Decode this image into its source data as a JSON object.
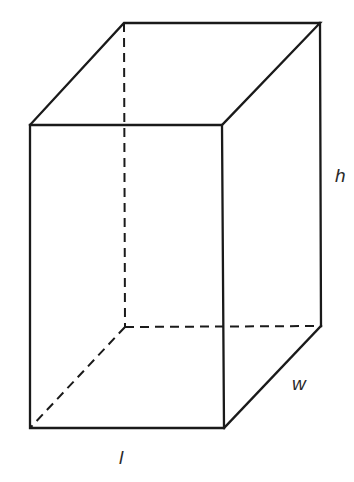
{
  "figure": {
    "type": "rectangular-prism",
    "labels": {
      "height": "h",
      "width": "w",
      "length": "l"
    },
    "colors": {
      "stroke": "#1a1a1a",
      "background": "#ffffff"
    }
  }
}
